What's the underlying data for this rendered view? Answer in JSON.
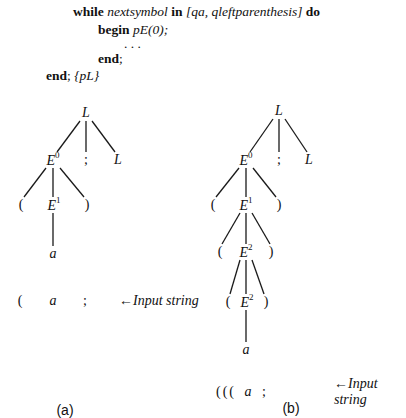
{
  "code": {
    "line1": {
      "kw_while": "while",
      "var": "nextsymbol",
      "kw_in": "in",
      "set": "[qa, qleftparenthesis]",
      "kw_do": "do"
    },
    "line2": {
      "kw_begin": "begin",
      "call": "pE(0);"
    },
    "line3": {
      "ellipsis": ". . ."
    },
    "line4": {
      "kw_end": "end",
      "punct": ";"
    },
    "line5": {
      "kw_end": "end",
      "punct": ";",
      "comment": "{pL}"
    }
  },
  "tree_a": {
    "caption": "(a)",
    "nodes": {
      "root": {
        "label": "L"
      },
      "e0": {
        "label": "E",
        "sup": "0"
      },
      "semi": {
        "label": ";"
      },
      "l2": {
        "label": "L"
      },
      "lp": {
        "label": "("
      },
      "e1": {
        "label": "E",
        "sup": "1"
      },
      "rp": {
        "label": ")"
      },
      "a": {
        "label": "a"
      }
    },
    "input": {
      "tokens": [
        "(",
        "a",
        ";"
      ],
      "label": "←Input string"
    }
  },
  "tree_b": {
    "caption": "(b)",
    "nodes": {
      "root": {
        "label": "L"
      },
      "e0": {
        "label": "E",
        "sup": "0"
      },
      "semi": {
        "label": ";"
      },
      "l2": {
        "label": "L"
      },
      "lp1": {
        "label": "("
      },
      "e1": {
        "label": "E",
        "sup": "1"
      },
      "rp1": {
        "label": ")"
      },
      "lp2": {
        "label": "("
      },
      "e2a": {
        "label": "E",
        "sup": "2"
      },
      "rp2": {
        "label": ")"
      },
      "lp3": {
        "label": "("
      },
      "e2b": {
        "label": "E",
        "sup": "2"
      },
      "rp3": {
        "label": ")"
      },
      "a": {
        "label": "a"
      }
    },
    "input": {
      "tokens": [
        "(((",
        "a",
        ";"
      ],
      "label": "←Input string"
    }
  }
}
